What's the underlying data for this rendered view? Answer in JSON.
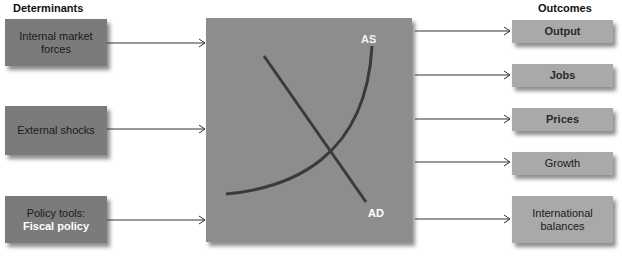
{
  "headings": {
    "left": "Determinants",
    "right": "Outcomes"
  },
  "determinants": [
    {
      "label": "Internal market forces"
    },
    {
      "label": "External shocks"
    },
    {
      "label_line1": "Policy tools:",
      "label_line2": "Fiscal policy"
    }
  ],
  "chart": {
    "curves": [
      {
        "name": "AS",
        "label": "AS",
        "shape": "upward-curving"
      },
      {
        "name": "AD",
        "label": "AD",
        "shape": "downward-sloping line"
      }
    ]
  },
  "outcomes": [
    {
      "label": "Output"
    },
    {
      "label": "Jobs"
    },
    {
      "label": "Prices"
    },
    {
      "label": "Growth"
    },
    {
      "label": "International balances"
    }
  ],
  "colors": {
    "determinant_box": "#7b7b7b",
    "center_box": "#8d8d8d",
    "outcome_box": "#a9a9a9",
    "curve": "#3a3a3a",
    "arrow": "#333333",
    "highlight_text": "#ffffff"
  }
}
